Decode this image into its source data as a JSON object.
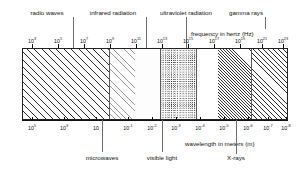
{
  "figure": {
    "frequency_axis_title": "frequency in hertz  (Hz)",
    "wavelength_axis_title": "wavelength in meters  (m)"
  },
  "top_labels": [
    {
      "name": "radio-waves",
      "text": "radio waves",
      "x": 47,
      "leader_x": 73,
      "leader_top": 17,
      "leader_h": 31
    },
    {
      "name": "infrared-radiation",
      "text": "infrared radiation",
      "x": 113,
      "leader_x": 146,
      "leader_top": 17,
      "leader_h": 31
    },
    {
      "name": "ultraviolet-radiation",
      "text": "ultraviolet radiation",
      "x": 186,
      "leader_x": 186,
      "leader_top": 17,
      "leader_h": 31
    },
    {
      "name": "gamma-rays",
      "text": "gamma rays",
      "x": 246,
      "leader_x": 265,
      "leader_top": 17,
      "leader_h": 12
    }
  ],
  "bottom_labels": [
    {
      "name": "microwaves",
      "text": "microwaves",
      "x": 102,
      "leader_x": 102,
      "leader_top": 120,
      "leader_h": 32
    },
    {
      "name": "visible-light",
      "text": "visible light",
      "x": 162,
      "leader_x": 162,
      "leader_top": 120,
      "leader_h": 32
    },
    {
      "name": "x-rays",
      "text": "X-rays",
      "x": 236,
      "leader_x": 236,
      "leader_top": 120,
      "leader_h": 32
    }
  ],
  "chart_data": {
    "type": "bar",
    "xlabel": "frequency in hertz (Hz)",
    "ylabel": "wavelength in meters (m)",
    "grid": false,
    "legend": "none",
    "frequency_axis": {
      "title": "frequency in hertz  (Hz)",
      "unit": "Hz",
      "position": "top",
      "range": [
        "10^3",
        "10^23"
      ],
      "ticks": [
        {
          "label": "10",
          "exp": "3",
          "x": 32
        },
        {
          "label": "10",
          "exp": "5",
          "x": 58
        },
        {
          "label": "10",
          "exp": "7",
          "x": 84
        },
        {
          "label": "10",
          "exp": "9",
          "x": 110
        },
        {
          "label": "10",
          "exp": "11",
          "x": 136
        },
        {
          "label": "10",
          "exp": "13",
          "x": 162
        },
        {
          "label": "10",
          "exp": "15",
          "x": 188
        },
        {
          "label": "10",
          "exp": "17",
          "x": 214
        },
        {
          "label": "10",
          "exp": "19",
          "x": 240
        },
        {
          "label": "10",
          "exp": "21",
          "x": 262
        },
        {
          "label": "10",
          "exp": "23",
          "x": 283
        }
      ]
    },
    "wavelength_axis": {
      "title": "wavelength in meters  (m)",
      "unit": "m",
      "position": "bottom",
      "range": [
        "10^5",
        "10^-8"
      ],
      "ticks": [
        {
          "label": "10",
          "exp": "5",
          "x": 32
        },
        {
          "label": "10",
          "exp": "3",
          "x": 64
        },
        {
          "label": "10",
          "exp": "",
          "x": 96
        },
        {
          "label": "10",
          "exp": "-1",
          "x": 128
        },
        {
          "label": "10",
          "exp": "-2",
          "x": 152
        },
        {
          "label": "10",
          "exp": "-3",
          "x": 176
        },
        {
          "label": "10",
          "exp": "-4",
          "x": 200
        },
        {
          "label": "10",
          "exp": "-5",
          "x": 224
        },
        {
          "label": "10",
          "exp": "-6",
          "x": 248
        },
        {
          "label": "10",
          "exp": "-7",
          "x": 268
        },
        {
          "label": "10",
          "exp": "-8",
          "x": 286
        }
      ]
    },
    "bands": [
      {
        "name": "radio waves",
        "left": 0,
        "width": 86,
        "fill": "wide-diagonal-hatch"
      },
      {
        "name": "microwaves",
        "left": 86,
        "width": 26,
        "fill": "pale-diagonal-hatch"
      },
      {
        "name": "infrared radiation",
        "left": 112,
        "width": 25,
        "fill": "blank"
      },
      {
        "name": "visible light",
        "left": 137,
        "width": 36,
        "fill": "stipple"
      },
      {
        "name": "ultraviolet radiation",
        "left": 173,
        "width": 22,
        "fill": "sparse-dot"
      },
      {
        "name": "x-rays",
        "left": 195,
        "width": 33,
        "fill": "tight-diagonal-hatch"
      },
      {
        "name": "gamma rays",
        "left": 228,
        "width": 38,
        "fill": "medium-diagonal-hatch"
      }
    ]
  },
  "colors": {
    "ink": "#111111",
    "hatch": "#2b2b2b",
    "leader": "#6d6d6d",
    "background": "#ffffff"
  }
}
